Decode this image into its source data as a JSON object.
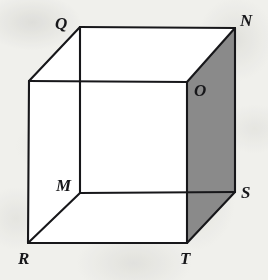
{
  "figure": {
    "kind": "geometry-diagram",
    "shape": "cube",
    "canvas": {
      "width": 268,
      "height": 280
    },
    "colors": {
      "background": "#f7f7f5",
      "paper_blotch": "#b4b4ae",
      "stroke": "#17171a",
      "face_white": "#ffffff",
      "face_shaded": "#8a8a8a",
      "label": "#17171a"
    },
    "stroke_width": 2.1,
    "vertices": [
      {
        "id": "Q",
        "label": "Q",
        "x": 80,
        "y": 27,
        "label_x": 55,
        "label_y": 15,
        "labeled": true
      },
      {
        "id": "N",
        "label": "N",
        "x": 235,
        "y": 28,
        "label_x": 240,
        "label_y": 12,
        "labeled": true
      },
      {
        "id": "O",
        "label": "O",
        "x": 187,
        "y": 82,
        "label_x": 194,
        "label_y": 82,
        "labeled": true
      },
      {
        "id": "P",
        "label": "",
        "x": 29,
        "y": 81,
        "label_x": 0,
        "label_y": 0,
        "labeled": false
      },
      {
        "id": "M",
        "label": "M",
        "x": 80,
        "y": 193,
        "label_x": 56,
        "label_y": 177,
        "labeled": true
      },
      {
        "id": "S",
        "label": "S",
        "x": 235,
        "y": 192,
        "label_x": 241,
        "label_y": 184,
        "labeled": true
      },
      {
        "id": "R",
        "label": "R",
        "x": 28,
        "y": 243,
        "label_x": 18,
        "label_y": 250,
        "labeled": true
      },
      {
        "id": "T",
        "label": "T",
        "x": 187,
        "y": 243,
        "label_x": 180,
        "label_y": 250,
        "labeled": true
      }
    ],
    "faces": [
      {
        "id": "face-ONST",
        "name": "shaded-right-face",
        "points": "187,82 235,28 235,192 187,243",
        "fill": "#8a8a8a",
        "shaded": true
      },
      {
        "id": "face-PORT",
        "name": "front-face",
        "points": "29,81 187,82 187,243 28,243",
        "fill": "#ffffff",
        "shaded": false
      },
      {
        "id": "face-QNOP",
        "name": "top-face",
        "points": "80,27 235,28 187,82 29,81",
        "fill": "#ffffff",
        "shaded": false
      }
    ],
    "edges": [
      {
        "id": "edge-QN",
        "from": "Q",
        "to": "N",
        "hidden": false
      },
      {
        "id": "edge-NS",
        "from": "N",
        "to": "S",
        "hidden": false
      },
      {
        "id": "edge-ST",
        "from": "S",
        "to": "T",
        "hidden": false
      },
      {
        "id": "edge-TR",
        "from": "T",
        "to": "R",
        "hidden": false
      },
      {
        "id": "edge-RP",
        "from": "R",
        "to": "P",
        "hidden": false
      },
      {
        "id": "edge-PQ",
        "from": "P",
        "to": "Q",
        "hidden": false
      },
      {
        "id": "edge-PO",
        "from": "P",
        "to": "O",
        "hidden": false
      },
      {
        "id": "edge-ON",
        "from": "O",
        "to": "N",
        "hidden": false
      },
      {
        "id": "edge-OT",
        "from": "O",
        "to": "T",
        "hidden": false
      },
      {
        "id": "edge-QM",
        "from": "Q",
        "to": "M",
        "hidden": false
      },
      {
        "id": "edge-MS",
        "from": "M",
        "to": "S",
        "hidden": false
      },
      {
        "id": "edge-MR",
        "from": "M",
        "to": "R",
        "hidden": false
      }
    ],
    "labels": {
      "Q": "Q",
      "N": "N",
      "O": "O",
      "M": "M",
      "S": "S",
      "R": "R",
      "T": "T"
    }
  }
}
